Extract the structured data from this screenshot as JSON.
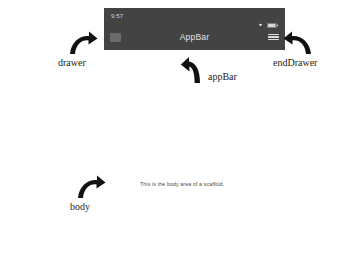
{
  "device": {
    "statusbar": {
      "time": "9:57",
      "wifi_icon": "wifi-icon",
      "battery_icon": "battery-icon"
    },
    "appbar": {
      "leading_icon": "menu-square-icon",
      "title": "AppBar",
      "trailing_icon": "hamburger-menu-icon"
    },
    "body": {
      "text": "This is the body area of a scaffold."
    },
    "colors": {
      "appbar_background": "#434343",
      "appbar_title": "#e2e2e2",
      "status_text": "#d8d8d8",
      "page_background": "#ffffff",
      "annotation_text": "#1d1d1d"
    }
  },
  "annotations": [
    {
      "id": "drawer",
      "label": "drawer",
      "arrow_icon": "curved-arrow-up-right-icon"
    },
    {
      "id": "endDrawer",
      "label": "endDrawer",
      "arrow_icon": "curved-arrow-up-left-icon"
    },
    {
      "id": "appBar",
      "label": "appBar",
      "arrow_icon": "curved-arrow-up-icon"
    },
    {
      "id": "body",
      "label": "body",
      "arrow_icon": "curved-arrow-up-right-icon"
    }
  ]
}
